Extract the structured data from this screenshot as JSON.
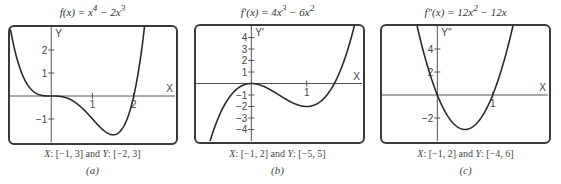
{
  "chart_data": [
    {
      "id": "a",
      "type": "line",
      "title": "f(x) = x^4 − 2x^3",
      "title_parts": {
        "fn": "f(x) = x",
        "exp1": "4",
        "mid": " − 2x",
        "exp2": "3"
      },
      "function": "x^4 - 2x^3",
      "xlabel": "X",
      "ylabel": "Y",
      "xlim": [
        -1,
        3
      ],
      "ylim": [
        -2,
        3
      ],
      "x_ticks": [
        {
          "value": 1,
          "label": "1"
        },
        {
          "value": 2,
          "label": "2"
        }
      ],
      "y_ticks": [
        {
          "value": 2,
          "label": "2"
        },
        {
          "value": 1,
          "label": "1"
        },
        {
          "value": -1,
          "label": "−1"
        }
      ],
      "grid": false,
      "caption": "X: [−1, 3] and Y: [−2, 3]",
      "caption_parts": {
        "x_label": "X",
        "x_range": ": [−1, 3] and ",
        "y_label": "Y",
        "y_range": ": [−2, 3]"
      },
      "sublabel": "(a)",
      "sample_points": [
        {
          "x": -1,
          "y": 3
        },
        {
          "x": -0.5,
          "y": 0.3125
        },
        {
          "x": 0,
          "y": 0
        },
        {
          "x": 0.5,
          "y": -0.1875
        },
        {
          "x": 1,
          "y": -1
        },
        {
          "x": 1.5,
          "y": -1.6875
        },
        {
          "x": 2,
          "y": 0
        },
        {
          "x": 2.5,
          "y": 7.8125
        }
      ]
    },
    {
      "id": "b",
      "type": "line",
      "title": "f′(x) = 4x^3 − 6x^2",
      "title_parts": {
        "fn": "f′(x) = 4x",
        "exp1": "3",
        "mid": " − 6x",
        "exp2": "2"
      },
      "function": "4x^3 - 6x^2",
      "xlabel": "X",
      "ylabel": "Y′",
      "xlim": [
        -1,
        2
      ],
      "ylim": [
        -5,
        5
      ],
      "x_ticks": [
        {
          "value": 1,
          "label": "1"
        }
      ],
      "y_ticks": [
        {
          "value": 4,
          "label": "4"
        },
        {
          "value": 3,
          "label": "3"
        },
        {
          "value": 2,
          "label": "2"
        },
        {
          "value": 1,
          "label": "1"
        },
        {
          "value": -1,
          "label": "−1"
        },
        {
          "value": -2,
          "label": "−2"
        },
        {
          "value": -3,
          "label": "−3"
        },
        {
          "value": -4,
          "label": "−4"
        }
      ],
      "grid": false,
      "caption": "X: [−1, 2] and Y: [−5, 5]",
      "caption_parts": {
        "x_label": "X",
        "x_range": ": [−1, 2] and ",
        "y_label": "Y",
        "y_range": ": [−5, 5]"
      },
      "sublabel": "(b)",
      "sample_points": [
        {
          "x": -1,
          "y": -10
        },
        {
          "x": -0.5,
          "y": -2
        },
        {
          "x": 0,
          "y": 0
        },
        {
          "x": 0.5,
          "y": -1
        },
        {
          "x": 1,
          "y": -2
        },
        {
          "x": 1.5,
          "y": 0
        },
        {
          "x": 2,
          "y": 8
        }
      ]
    },
    {
      "id": "c",
      "type": "line",
      "title": "f″(x) = 12x^2 − 12x",
      "title_parts": {
        "fn": "f″(x) = 12x",
        "exp1": "2",
        "mid": " − 12x",
        "exp2": ""
      },
      "function": "12x^2 - 12x",
      "xlabel": "X",
      "ylabel": "Y′′",
      "xlim": [
        -1,
        2
      ],
      "ylim": [
        -4,
        6
      ],
      "x_ticks": [
        {
          "value": 1,
          "label": "1"
        }
      ],
      "y_ticks": [
        {
          "value": 4,
          "label": "4"
        },
        {
          "value": 2,
          "label": "2"
        },
        {
          "value": -2,
          "label": "−2"
        }
      ],
      "grid": false,
      "caption": "X: [−1, 2] and Y: [−4, 6]",
      "caption_parts": {
        "x_label": "X",
        "x_range": ": [−1, 2] and ",
        "y_label": "Y",
        "y_range": ": [−4, 6]"
      },
      "sublabel": "(c)",
      "sample_points": [
        {
          "x": -0.5,
          "y": 9
        },
        {
          "x": 0,
          "y": 0
        },
        {
          "x": 0.5,
          "y": -3
        },
        {
          "x": 1,
          "y": 0
        },
        {
          "x": 1.5,
          "y": 9
        }
      ]
    }
  ],
  "layout": {
    "panels": [
      {
        "left": 0,
        "width": 185,
        "frame": {
          "x": 8,
          "y": 25,
          "w": 170,
          "h": 120
        }
      },
      {
        "left": 185,
        "width": 185,
        "frame": {
          "x": 9,
          "y": 24,
          "w": 171,
          "h": 120
        }
      },
      {
        "left": 370,
        "width": 191,
        "frame": {
          "x": 10,
          "y": 24,
          "w": 171,
          "h": 120
        }
      }
    ],
    "line_color": "#2b2b2b",
    "axis_color": "#555555",
    "frame_color": "#3a3a3a"
  }
}
